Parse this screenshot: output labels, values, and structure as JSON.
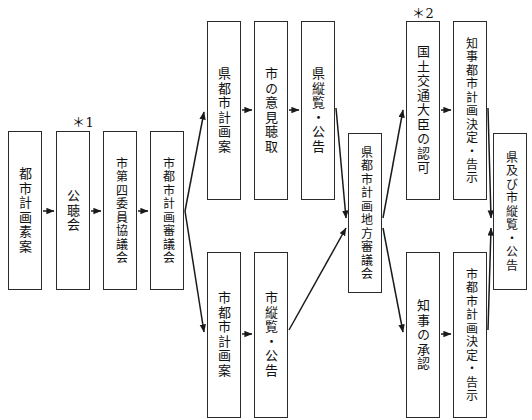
{
  "diagram": {
    "orientation": "left-to-right",
    "text_direction": "vertical",
    "annotations": [
      {
        "id": "note-1",
        "label": "＊1",
        "x": 72,
        "y": 112
      },
      {
        "id": "note-2",
        "label": "＊2",
        "x": 412,
        "y": 3
      }
    ],
    "nodes": [
      {
        "id": "n1",
        "label": "都市計画素案",
        "x": 8,
        "y": 131,
        "w": 34,
        "h": 159
      },
      {
        "id": "n2",
        "label": "公聴会",
        "x": 56,
        "y": 131,
        "w": 34,
        "h": 159
      },
      {
        "id": "n3",
        "label": "市第四委員協議会",
        "x": 103,
        "y": 131,
        "w": 34,
        "h": 159
      },
      {
        "id": "n4",
        "label": "市都市計画審議会",
        "x": 150,
        "y": 131,
        "w": 34,
        "h": 159
      },
      {
        "id": "n5",
        "label": "県都市計画案",
        "x": 207,
        "y": 21,
        "w": 34,
        "h": 179
      },
      {
        "id": "n6",
        "label": "市の意見聴取",
        "x": 254,
        "y": 21,
        "w": 34,
        "h": 179
      },
      {
        "id": "n7",
        "label": "県縦覧・公告",
        "x": 301,
        "y": 21,
        "w": 34,
        "h": 179
      },
      {
        "id": "n8",
        "label": "市都市計画案",
        "x": 207,
        "y": 252,
        "w": 34,
        "h": 166
      },
      {
        "id": "n9",
        "label": "市縦覧・公告",
        "x": 254,
        "y": 252,
        "w": 34,
        "h": 166
      },
      {
        "id": "n10",
        "label": "県都市計画地方審議会",
        "x": 348,
        "y": 133,
        "w": 34,
        "h": 160
      },
      {
        "id": "n11",
        "label": "国土交通大臣の認可",
        "x": 406,
        "y": 21,
        "w": 34,
        "h": 179
      },
      {
        "id": "n12",
        "label": "知事都市計画決定・告示",
        "x": 453,
        "y": 21,
        "w": 34,
        "h": 179
      },
      {
        "id": "n13",
        "label": "知事の承認",
        "x": 406,
        "y": 252,
        "w": 34,
        "h": 166
      },
      {
        "id": "n14",
        "label": "市都市計画決定・告示",
        "x": 453,
        "y": 252,
        "w": 34,
        "h": 166
      },
      {
        "id": "n15",
        "label": "県及び市縦覧・公告",
        "x": 493,
        "y": 133,
        "w": 34,
        "h": 157
      }
    ],
    "edges": [
      {
        "from": "n1",
        "to": "n2",
        "kind": "straight"
      },
      {
        "from": "n2",
        "to": "n3",
        "kind": "straight"
      },
      {
        "from": "n3",
        "to": "n4",
        "kind": "straight"
      },
      {
        "from": "n4",
        "to": "n5",
        "kind": "diagonal-up"
      },
      {
        "from": "n5",
        "to": "n6",
        "kind": "straight"
      },
      {
        "from": "n6",
        "to": "n7",
        "kind": "straight"
      },
      {
        "from": "n7",
        "to": "n10",
        "kind": "diagonal-down"
      },
      {
        "from": "n4",
        "to": "n8",
        "kind": "diagonal-down"
      },
      {
        "from": "n8",
        "to": "n9",
        "kind": "straight"
      },
      {
        "from": "n9",
        "to": "n10",
        "kind": "diagonal-up"
      },
      {
        "from": "n10",
        "to": "n11",
        "kind": "diagonal-up"
      },
      {
        "from": "n11",
        "to": "n12",
        "kind": "straight"
      },
      {
        "from": "n12",
        "to": "n15",
        "kind": "diagonal-down"
      },
      {
        "from": "n10",
        "to": "n13",
        "kind": "diagonal-down"
      },
      {
        "from": "n13",
        "to": "n14",
        "kind": "straight"
      },
      {
        "from": "n14",
        "to": "n15",
        "kind": "diagonal-up"
      }
    ],
    "colors": {
      "box_border": "#2b2b2b",
      "box_fill": "#ffffff",
      "text": "#111111",
      "edge": "#1a1a1a",
      "background": "#ffffff"
    }
  }
}
